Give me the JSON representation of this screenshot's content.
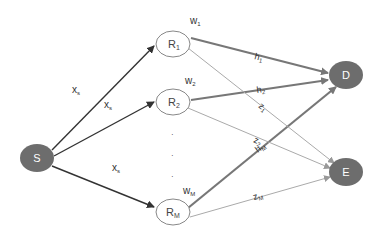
{
  "nodes": {
    "S": {
      "label": "S",
      "color": "#6d6d6d"
    },
    "R1": {
      "label": "R",
      "sub": "1"
    },
    "R2": {
      "label": "R",
      "sub": "2"
    },
    "RM": {
      "label": "R",
      "sub": "M"
    },
    "D": {
      "label": "D",
      "color": "#6d6d6d"
    },
    "E": {
      "label": "E",
      "color": "#6d6d6d"
    }
  },
  "weights": {
    "w1": {
      "label": "w",
      "sub": "1"
    },
    "w2": {
      "label": "w",
      "sub": "2"
    },
    "wM": {
      "label": "w",
      "sub": "M"
    }
  },
  "edges": {
    "s_r1": {
      "label": "x",
      "sub": "s"
    },
    "s_r2": {
      "label": "x",
      "sub": "s"
    },
    "s_rm": {
      "label": "x",
      "sub": "s"
    },
    "r1_d": {
      "label": "h",
      "sub": "1"
    },
    "r2_d": {
      "label": "h",
      "sub": "2"
    },
    "rm_d": {
      "label": "h",
      "sub": "M"
    },
    "r1_e": {
      "label": "z",
      "sub": "1"
    },
    "r2_e": {
      "label": "z",
      "sub": "2"
    },
    "rm_e": {
      "label": "z",
      "sub": "M"
    }
  },
  "ellipsis": "·"
}
